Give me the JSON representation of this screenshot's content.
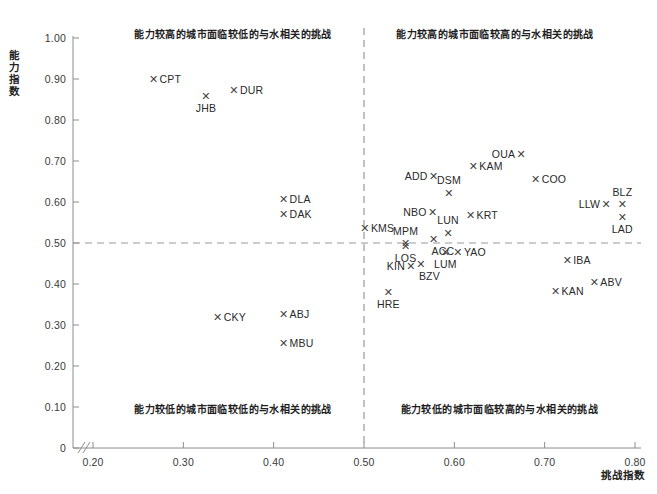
{
  "chart_data": {
    "type": "scatter",
    "title": "",
    "xlabel": "挑战指数",
    "ylabel": "能力指数",
    "xlim": [
      0.17,
      0.8
    ],
    "ylim": [
      0.0,
      1.02
    ],
    "xticks": [
      "0.20",
      "0.30",
      "0.40",
      "0.50",
      "0.60",
      "0.70",
      "0.80"
    ],
    "xtick_values": [
      0.2,
      0.3,
      0.4,
      0.5,
      0.6,
      0.7,
      0.8
    ],
    "yticks": [
      "0",
      "0.10",
      "0.20",
      "0.30",
      "0.40",
      "0.50",
      "0.60",
      "0.70",
      "0.80",
      "0.90",
      "1.00"
    ],
    "ytick_values": [
      0.0,
      0.1,
      0.2,
      0.3,
      0.4,
      0.5,
      0.6,
      0.7,
      0.8,
      0.9,
      1.0
    ],
    "grid": false,
    "axis_break": "//",
    "marker": "✕",
    "marker_color": "#444444",
    "reference_lines": [
      {
        "axis": "y",
        "value": 0.5,
        "style": "dashed",
        "color": "#9a9a9a"
      },
      {
        "axis": "x",
        "value": 0.5,
        "style": "dashed",
        "color": "#9a9a9a"
      }
    ],
    "quadrant_labels": [
      {
        "id": "top-left",
        "text": "能力较高的城市面临较低的与水相关的挑战",
        "x": 0.355,
        "y": 1.015
      },
      {
        "id": "top-right",
        "text": "能力较高的城市面临较高的与水相关的挑战",
        "x": 0.645,
        "y": 1.015
      },
      {
        "id": "bottom-left",
        "text": "能力较低的城市面临较低的与水相关的挑战",
        "x": 0.355,
        "y": 0.1
      },
      {
        "id": "bottom-right",
        "text": "能力较低的城市面临较高的与水相关的挑战",
        "x": 0.65,
        "y": 0.1
      }
    ],
    "points": [
      {
        "label": "CPT",
        "x": 0.267,
        "y": 0.901,
        "pos": "right"
      },
      {
        "label": "DUR",
        "x": 0.356,
        "y": 0.872,
        "pos": "right"
      },
      {
        "label": "JHB",
        "x": 0.325,
        "y": 0.858,
        "pos": "below"
      },
      {
        "label": "OUA",
        "x": 0.674,
        "y": 0.716,
        "pos": "left"
      },
      {
        "label": "KAM",
        "x": 0.621,
        "y": 0.688,
        "pos": "right"
      },
      {
        "label": "COO",
        "x": 0.69,
        "y": 0.657,
        "pos": "right"
      },
      {
        "label": "ADD",
        "x": 0.577,
        "y": 0.664,
        "pos": "left"
      },
      {
        "label": "DLA",
        "x": 0.411,
        "y": 0.607,
        "pos": "right"
      },
      {
        "label": "DSM",
        "x": 0.594,
        "y": 0.623,
        "pos": "above"
      },
      {
        "label": "BLZ",
        "x": 0.786,
        "y": 0.595,
        "pos": "above"
      },
      {
        "label": "LLW",
        "x": 0.768,
        "y": 0.594,
        "pos": "left"
      },
      {
        "label": "DAK",
        "x": 0.411,
        "y": 0.57,
        "pos": "right"
      },
      {
        "label": "NBO",
        "x": 0.576,
        "y": 0.576,
        "pos": "left"
      },
      {
        "label": "KRT",
        "x": 0.618,
        "y": 0.568,
        "pos": "right"
      },
      {
        "label": "LAD",
        "x": 0.786,
        "y": 0.563,
        "pos": "below"
      },
      {
        "label": "KMS",
        "x": 0.501,
        "y": 0.537,
        "pos": "right"
      },
      {
        "label": "LUN",
        "x": 0.593,
        "y": 0.525,
        "pos": "above"
      },
      {
        "label": "MPM",
        "x": 0.546,
        "y": 0.5,
        "pos": "above"
      },
      {
        "label": "ACC",
        "x": 0.577,
        "y": 0.509,
        "pos": "belowright"
      },
      {
        "label": "LOS",
        "x": 0.546,
        "y": 0.492,
        "pos": "below"
      },
      {
        "label": "YAO",
        "x": 0.604,
        "y": 0.477,
        "pos": "right"
      },
      {
        "label": "LUM",
        "x": 0.59,
        "y": 0.478,
        "pos": "below"
      },
      {
        "label": "IBA",
        "x": 0.725,
        "y": 0.458,
        "pos": "right"
      },
      {
        "label": "KIN",
        "x": 0.552,
        "y": 0.443,
        "pos": "left"
      },
      {
        "label": "BZV",
        "x": 0.563,
        "y": 0.45,
        "pos": "belowright"
      },
      {
        "label": "ABV",
        "x": 0.755,
        "y": 0.406,
        "pos": "right"
      },
      {
        "label": "KAN",
        "x": 0.712,
        "y": 0.383,
        "pos": "right"
      },
      {
        "label": "HRE",
        "x": 0.527,
        "y": 0.381,
        "pos": "below"
      },
      {
        "label": "ABJ",
        "x": 0.411,
        "y": 0.326,
        "pos": "right"
      },
      {
        "label": "CKY",
        "x": 0.338,
        "y": 0.32,
        "pos": "right"
      },
      {
        "label": "MBU",
        "x": 0.411,
        "y": 0.257,
        "pos": "right"
      }
    ]
  }
}
